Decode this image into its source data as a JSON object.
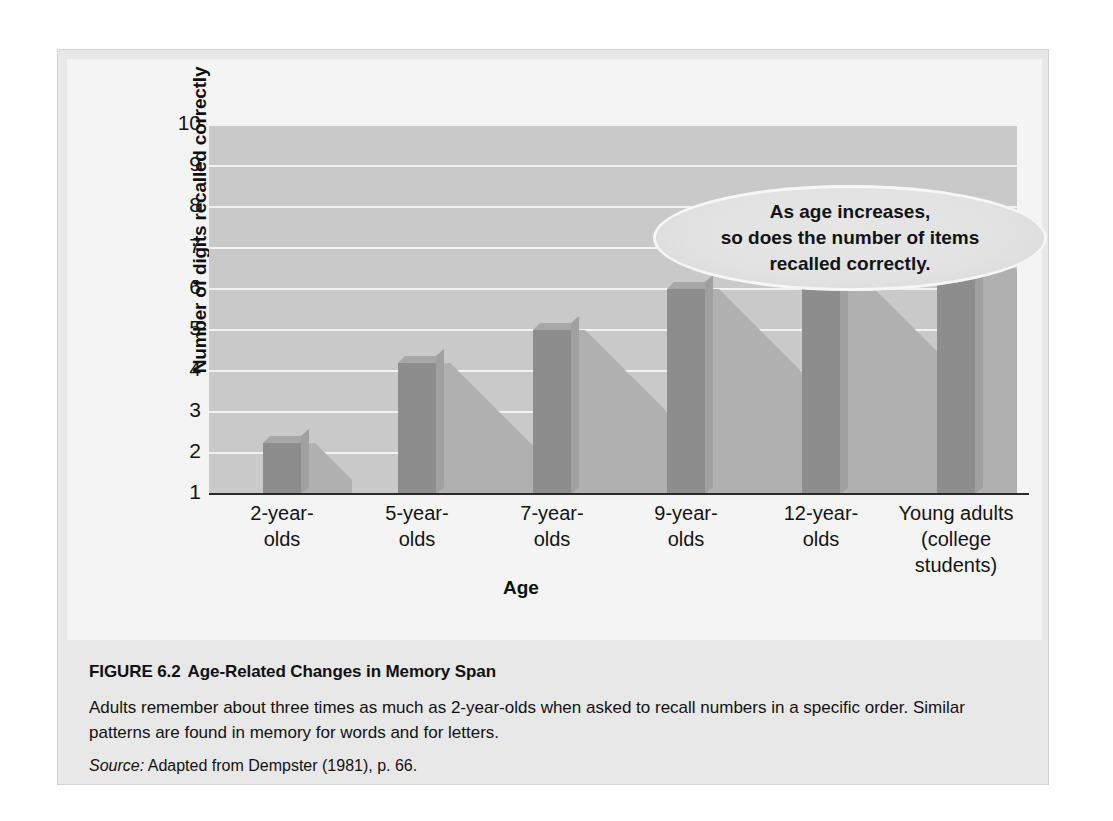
{
  "figure": {
    "caption_label": "FIGURE 6.2",
    "caption_title": "Age-Related Changes in Memory Span",
    "caption_body": "Adults remember about three times as much as 2-year-olds when asked to recall numbers in a specific order. Similar patterns are found in memory for words and for letters.",
    "source_label": "Source:",
    "source_text": "Adapted from Dempster (1981), p. 66."
  },
  "annotation": {
    "line1": "As age increases,",
    "line2": "so does  the number of items",
    "line3": "recalled correctly."
  },
  "colors": {
    "plot_background": "#c9c9c9",
    "gridline": "#f2f2f2",
    "bar_fill": "#8d8d8d",
    "bar_top": "#a7a7a7",
    "bar_side": "#a0a0a0",
    "shadow": "#b0b0b0",
    "axis": "#2a2a2a",
    "panel": "#f4f4f4",
    "card": "#e8e8e8"
  },
  "chart_data": {
    "type": "bar",
    "title": "Age-Related Changes in Memory Span",
    "xlabel": "Age",
    "ylabel": "Number of digits recalled correctly",
    "categories": [
      "2-year-\nolds",
      "5-year-\nolds",
      "7-year-\nolds",
      "9-year-\nolds",
      "12-year-\nolds",
      "Young adults\n(college\nstudents)"
    ],
    "category_lines": [
      [
        "2-year-",
        "olds"
      ],
      [
        "5-year-",
        "olds"
      ],
      [
        "7-year-",
        "olds"
      ],
      [
        "9-year-",
        "olds"
      ],
      [
        "12-year-",
        "olds"
      ],
      [
        "Young adults",
        "(college",
        "students)"
      ]
    ],
    "values": [
      2.25,
      4.2,
      5.0,
      6.0,
      6.5,
      7.15
    ],
    "ylim": [
      1,
      10
    ],
    "yticks": [
      10,
      9,
      8,
      7,
      6,
      5,
      4,
      3,
      2,
      1
    ],
    "grid": true,
    "legend": "none"
  }
}
